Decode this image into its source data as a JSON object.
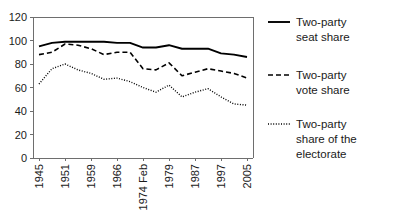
{
  "chart_data": {
    "type": "line",
    "title": "",
    "subtitle": "",
    "xlabel": "",
    "ylabel": "",
    "grid": false,
    "legend_position": "right",
    "ylim": [
      0,
      120
    ],
    "yticks": [
      0,
      20,
      40,
      60,
      80,
      100,
      120
    ],
    "ytick_labels": [
      "0",
      "20",
      "40",
      "60",
      "80",
      "100",
      "120"
    ],
    "categories": [
      "1945",
      "1950",
      "1951",
      "1955",
      "1959",
      "1964",
      "1966",
      "1970",
      "1974 Feb",
      "1974 Oct",
      "1979",
      "1983",
      "1987",
      "1992",
      "1997",
      "2001",
      "2005"
    ],
    "xtick_labels": [
      "1945",
      "1951",
      "1959",
      "1966",
      "1974 Feb",
      "1979",
      "1987",
      "1997",
      "2005"
    ],
    "xtick_indices": [
      0,
      2,
      4,
      6,
      8,
      10,
      12,
      14,
      16
    ],
    "series": [
      {
        "name": "Two-party seat share",
        "style": "solid",
        "color": "#000000",
        "values": [
          95,
          98,
          99,
          99,
          99,
          99,
          98,
          98,
          94,
          94,
          96,
          93,
          93,
          93,
          89,
          88,
          86
        ]
      },
      {
        "name": "Two-party vote share",
        "style": "dashed",
        "color": "#000000",
        "values": [
          88,
          90,
          97,
          96,
          93,
          88,
          90,
          90,
          76,
          75,
          81,
          70,
          73,
          76,
          74,
          72,
          68
        ]
      },
      {
        "name": "Two-party share of the electorate",
        "style": "dotted",
        "color": "#000000",
        "values": [
          63,
          76,
          80,
          75,
          72,
          67,
          68,
          65,
          60,
          56,
          62,
          52,
          56,
          59,
          52,
          46,
          45
        ]
      }
    ]
  },
  "legend": {
    "entries": [
      {
        "label_line_1": "Two-party",
        "label_line_2": "seat share",
        "label_line_3": ""
      },
      {
        "label_line_1": "Two-party",
        "label_line_2": "vote share",
        "label_line_3": ""
      },
      {
        "label_line_1": "Two-party",
        "label_line_2": "share of the",
        "label_line_3": "electorate"
      }
    ]
  }
}
